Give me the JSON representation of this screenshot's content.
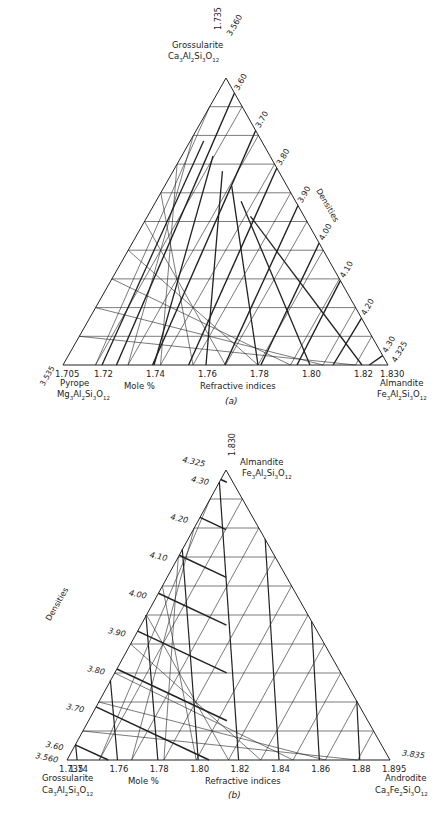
{
  "diagrams": [
    {
      "id": "a",
      "caption": "(a)",
      "vertices": {
        "top": {
          "name": "Grossularite",
          "formula": [
            "Ca",
            "3",
            "Al",
            "2",
            "Si",
            "3",
            "O",
            "12"
          ],
          "ri": "1.735",
          "density": "3.560"
        },
        "left": {
          "name": "Pyrope",
          "formula": [
            "Mg",
            "3",
            "Al",
            "2",
            "Si",
            "3",
            "O",
            "12"
          ],
          "ri": "1.705",
          "density": "3.535"
        },
        "right": {
          "name": "Almandite",
          "formula": [
            "Fe",
            "3",
            "Al",
            "2",
            "Si",
            "3",
            "O",
            "12"
          ],
          "ri": "1.830",
          "density": "4.325"
        }
      },
      "bottom_ticks": [
        "1.705",
        "1.72",
        "1.74",
        "1.76",
        "1.78",
        "1.80",
        "1.82",
        "1.830"
      ],
      "mole_label": "Mole %",
      "ri_label": "Refractive indices",
      "density_label": "Densities",
      "density_ticks": [
        "3.60",
        "3.70",
        "3.80",
        "3.90",
        "4.00",
        "4.10",
        "4.20",
        "4.30",
        "4.325"
      ]
    },
    {
      "id": "b",
      "caption": "(b)",
      "vertices": {
        "top": {
          "name": "Almandite",
          "formula": [
            "Fe",
            "3",
            "Al",
            "2",
            "Si",
            "3",
            "O",
            "12"
          ],
          "ri": "1.830",
          "density": "4.325"
        },
        "left": {
          "name": "Grossularite",
          "formula": [
            "Ca",
            "3",
            "Al",
            "2",
            "Si",
            "3",
            "O",
            "12"
          ],
          "ri": "1.735",
          "density": "3.560"
        },
        "right": {
          "name": "Androdite",
          "formula": [
            "Ca",
            "3",
            "Fe",
            "2",
            "Si",
            "3",
            "O",
            "12"
          ],
          "ri": "1.895",
          "density": "3.835"
        }
      },
      "bottom_ticks": [
        "1.735",
        "1.74",
        "1.76",
        "1.78",
        "1.80",
        "1.82",
        "1.84",
        "1.86",
        "1.88",
        "1.895"
      ],
      "mole_label": "Mole %",
      "ri_label": "Refractive indices",
      "density_label": "Densities",
      "density_ticks": [
        "3.560",
        "3.60",
        "3.70",
        "3.80",
        "3.90",
        "4.00",
        "4.10",
        "4.20",
        "4.30",
        "4.325"
      ]
    }
  ]
}
